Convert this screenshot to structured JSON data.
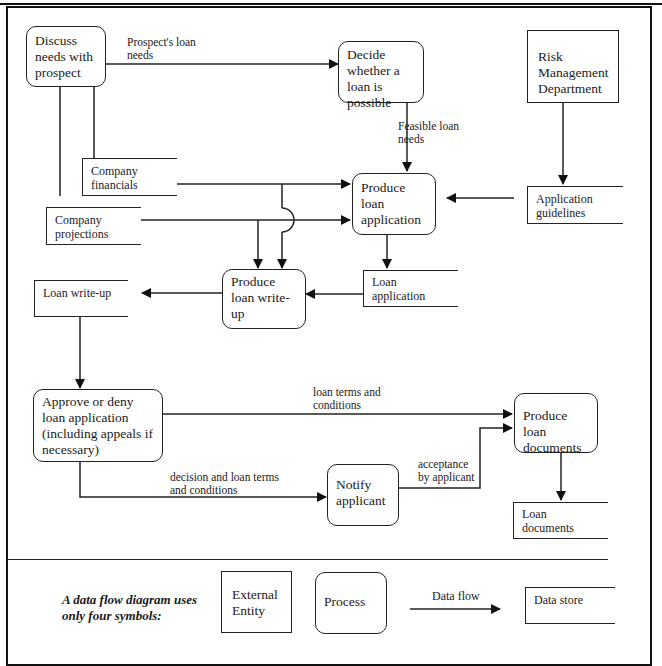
{
  "diagram": {
    "type": "data-flow-diagram",
    "processes": {
      "discuss": "Discuss needs with prospect",
      "decide": "Decide whether a loan is possible",
      "produce_application": "Produce loan application",
      "produce_writeup": "Produce loan write-up",
      "approve": "Approve or deny loan application (including appeals if necessary)",
      "notify": "Notify applicant",
      "produce_documents": "Produce loan documents"
    },
    "entities": {
      "risk": "Risk Management Department"
    },
    "stores": {
      "financials": "Company financials",
      "projections": "Company projections",
      "guidelines": "Application guidelines",
      "loan_application": "Loan application",
      "writeup": "Loan write-up",
      "documents": "Loan documents"
    },
    "flows": {
      "prospect_needs": "Prospect's loan needs",
      "feasible_needs": "Feasible loan needs",
      "terms": "loan terms and conditions",
      "decision_terms": "decision and loan terms and conditions",
      "acceptance": "acceptance by applicant"
    }
  },
  "legend": {
    "caption": "A data flow diagram uses only four symbols:",
    "external_entity": "External Entity",
    "process": "Process",
    "data_flow": "Data flow",
    "data_store": "Data store"
  }
}
